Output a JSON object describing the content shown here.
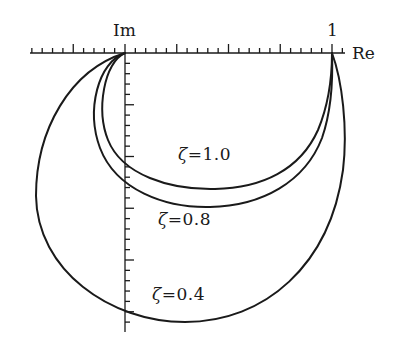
{
  "figure": {
    "axes": {
      "real_label": "Re",
      "imag_label": "Im",
      "unit_label": "1",
      "origin_px": [
        125,
        53
      ],
      "unit_px": 207
    },
    "curves": [
      {
        "name": "zeta-1-0",
        "zeta_symbol": "ζ",
        "equals": "=",
        "value": "1.0",
        "path": "M125,53 C104,62 96,110 108,140 C122,175 170,190 215,189 C262,188 300,170 318,130 C328,106 332,78 332,53"
      },
      {
        "name": "zeta-0-8",
        "zeta_symbol": "ζ",
        "equals": "=",
        "value": "0.8",
        "path": "M125,53 C98,62 86,110 100,148 C116,190 165,208 210,207 C262,206 305,182 322,138 C331,112 333,80 332,53"
      },
      {
        "name": "zeta-0-4",
        "zeta_symbol": "ζ",
        "equals": "=",
        "value": "0.4",
        "path": "M125,53 C70,70 36,130 36,196 C37,270 110,322 185,322 C265,322 330,265 343,170 C348,128 342,80 332,53"
      }
    ],
    "labels": [
      {
        "for": "zeta-1-0",
        "x": 178,
        "y": 146
      },
      {
        "for": "zeta-0-8",
        "x": 158,
        "y": 211
      },
      {
        "for": "zeta-0-4",
        "x": 152,
        "y": 286
      }
    ],
    "stroke_color": "#1a1a1a"
  }
}
